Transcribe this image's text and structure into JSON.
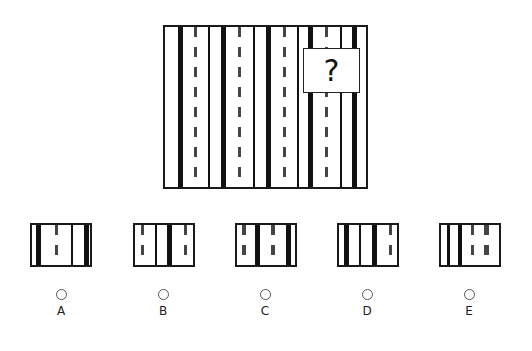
{
  "puzzle": {
    "question_mark": "?",
    "main_panel": {
      "stripes": [
        {
          "type": "thick",
          "x": 13,
          "w": 5
        },
        {
          "type": "dashed",
          "x": 29,
          "w": 3
        },
        {
          "type": "thin",
          "x": 43,
          "w": 2
        },
        {
          "type": "thick",
          "x": 56,
          "w": 5
        },
        {
          "type": "dashed",
          "x": 73,
          "w": 3
        },
        {
          "type": "thin",
          "x": 88,
          "w": 2
        },
        {
          "type": "thick",
          "x": 101,
          "w": 5
        },
        {
          "type": "dashed",
          "x": 118,
          "w": 3
        },
        {
          "type": "thin",
          "x": 132,
          "w": 2
        },
        {
          "type": "thick",
          "x": 143,
          "w": 5
        },
        {
          "type": "dashed",
          "x": 160,
          "w": 3
        },
        {
          "type": "thin",
          "x": 175,
          "w": 2
        },
        {
          "type": "thick",
          "x": 187,
          "w": 5
        }
      ]
    }
  },
  "options": [
    {
      "label": "A",
      "stripes": [
        {
          "type": "thick",
          "x": 4,
          "w": 5
        },
        {
          "type": "dashed",
          "x": 23,
          "w": 3
        },
        {
          "type": "thin",
          "x": 39,
          "w": 2
        },
        {
          "type": "thick",
          "x": 52,
          "w": 5
        }
      ]
    },
    {
      "label": "B",
      "stripes": [
        {
          "type": "dashed",
          "x": 6,
          "w": 3
        },
        {
          "type": "thin",
          "x": 20,
          "w": 2
        },
        {
          "type": "thick",
          "x": 32,
          "w": 5
        },
        {
          "type": "dashed",
          "x": 49,
          "w": 3
        }
      ]
    },
    {
      "label": "C",
      "stripes": [
        {
          "type": "dashed",
          "x": 5,
          "w": 4
        },
        {
          "type": "thick",
          "x": 18,
          "w": 5
        },
        {
          "type": "dashed",
          "x": 34,
          "w": 4
        },
        {
          "type": "thick",
          "x": 49,
          "w": 5
        }
      ]
    },
    {
      "label": "D",
      "stripes": [
        {
          "type": "thick",
          "x": 5,
          "w": 5
        },
        {
          "type": "thin",
          "x": 20,
          "w": 2
        },
        {
          "type": "thick",
          "x": 33,
          "w": 5
        },
        {
          "type": "dashed",
          "x": 50,
          "w": 3
        }
      ]
    },
    {
      "label": "E",
      "stripes": [
        {
          "type": "thin",
          "x": 6,
          "w": 3
        },
        {
          "type": "thick",
          "x": 17,
          "w": 4
        },
        {
          "type": "dashed",
          "x": 30,
          "w": 3
        },
        {
          "type": "dashed",
          "x": 43,
          "w": 5
        }
      ]
    }
  ]
}
